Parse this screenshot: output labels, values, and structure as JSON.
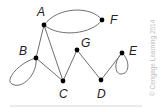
{
  "figure": {
    "type": "graph",
    "watermark": "© Cengage Learning 2014",
    "vertices": [
      {
        "id": "A",
        "label": "A",
        "x": 44,
        "y": 25,
        "lx": 37,
        "ly": 16
      },
      {
        "id": "B",
        "label": "B",
        "x": 36,
        "y": 58,
        "lx": 19,
        "ly": 55
      },
      {
        "id": "C",
        "label": "C",
        "x": 63,
        "y": 81,
        "lx": 59,
        "ly": 98
      },
      {
        "id": "D",
        "label": "D",
        "x": 101,
        "y": 80,
        "lx": 97,
        "ly": 98
      },
      {
        "id": "E",
        "label": "E",
        "x": 122,
        "y": 53,
        "lx": 129,
        "ly": 55
      },
      {
        "id": "F",
        "label": "F",
        "x": 102,
        "y": 20,
        "lx": 110,
        "ly": 24
      },
      {
        "id": "G",
        "label": "G",
        "x": 77,
        "y": 50,
        "lx": 81,
        "ly": 47
      }
    ],
    "edges": [
      {
        "from": "A",
        "to": "F",
        "kind": "arc-upper"
      },
      {
        "from": "A",
        "to": "F",
        "kind": "arc-lower"
      },
      {
        "from": "A",
        "to": "B",
        "kind": "line"
      },
      {
        "from": "A",
        "to": "C",
        "kind": "line"
      },
      {
        "from": "B",
        "to": "C",
        "kind": "line"
      },
      {
        "from": "B",
        "to": "B",
        "kind": "loop"
      },
      {
        "from": "C",
        "to": "G",
        "kind": "line"
      },
      {
        "from": "G",
        "to": "D",
        "kind": "line"
      },
      {
        "from": "D",
        "to": "E",
        "kind": "line"
      },
      {
        "from": "E",
        "to": "E",
        "kind": "loop"
      }
    ],
    "colors": {
      "edge": "#6e6e6e",
      "vertex": "#000000",
      "label": "#222222",
      "watermark": "#bdbdbd"
    }
  }
}
